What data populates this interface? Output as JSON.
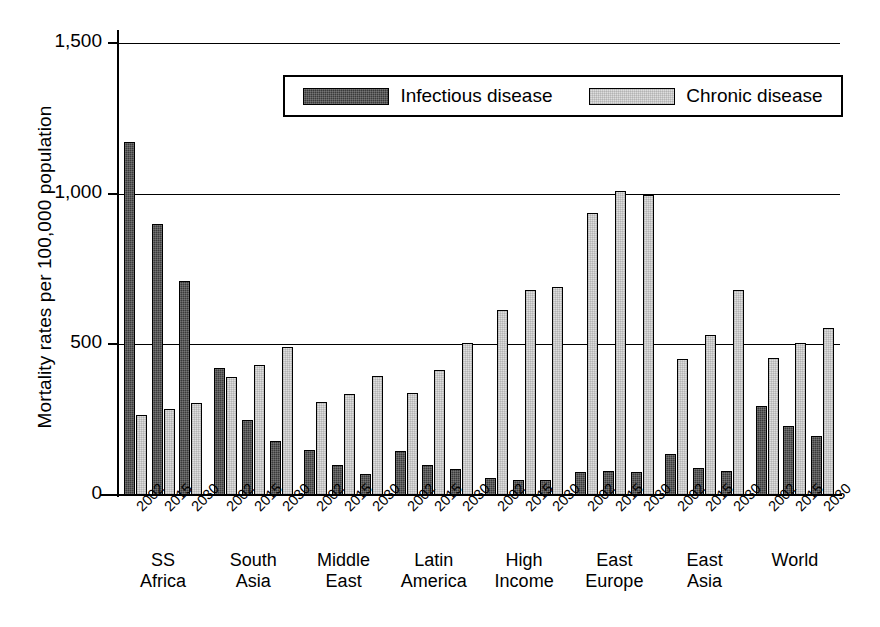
{
  "chart_data": {
    "type": "bar",
    "title": "",
    "xlabel": "",
    "ylabel": "Mortality rates per 100,000 population",
    "ylim": [
      0,
      1500
    ],
    "yticks": [
      "0",
      "500",
      "1,000",
      "1,500"
    ],
    "ytick_values": [
      0,
      500,
      1000,
      1500
    ],
    "grid": true,
    "legend_position": "top-center",
    "legend": [
      "Infectious disease",
      "Chronic disease"
    ],
    "groups": [
      "SS Africa",
      "South Asia",
      "Middle East",
      "Latin America",
      "High Income",
      "East Europe",
      "East Asia",
      "World"
    ],
    "group_lines": [
      [
        "SS",
        "Africa"
      ],
      [
        "South",
        "Asia"
      ],
      [
        "Middle",
        "East"
      ],
      [
        "Latin",
        "America"
      ],
      [
        "High",
        "Income"
      ],
      [
        "East",
        "Europe"
      ],
      [
        "East",
        "Asia"
      ],
      [
        "World",
        ""
      ]
    ],
    "years": [
      "2002",
      "2015",
      "2030"
    ],
    "categories": [
      "SS Africa 2002",
      "SS Africa 2015",
      "SS Africa 2030",
      "South Asia 2002",
      "South Asia 2015",
      "South Asia 2030",
      "Middle East 2002",
      "Middle East 2015",
      "Middle East 2030",
      "Latin America 2002",
      "Latin America 2015",
      "Latin America 2030",
      "High Income 2002",
      "High Income 2015",
      "High Income 2030",
      "East Europe 2002",
      "East Europe 2015",
      "East Europe 2030",
      "East Asia 2002",
      "East Asia 2015",
      "East Asia 2030",
      "World 2002",
      "World 2015",
      "World 2030"
    ],
    "series": [
      {
        "name": "Infectious disease",
        "color": "#3a3a3a",
        "values": [
          1170,
          900,
          710,
          420,
          250,
          180,
          150,
          100,
          70,
          145,
          100,
          85,
          55,
          50,
          50,
          75,
          80,
          75,
          135,
          90,
          80,
          295,
          230,
          195
        ]
      },
      {
        "name": "Chronic disease",
        "color": "#dedede",
        "values": [
          265,
          285,
          305,
          390,
          430,
          490,
          310,
          335,
          395,
          340,
          415,
          505,
          615,
          680,
          690,
          935,
          1010,
          995,
          450,
          530,
          680,
          455,
          505,
          555
        ]
      }
    ]
  }
}
